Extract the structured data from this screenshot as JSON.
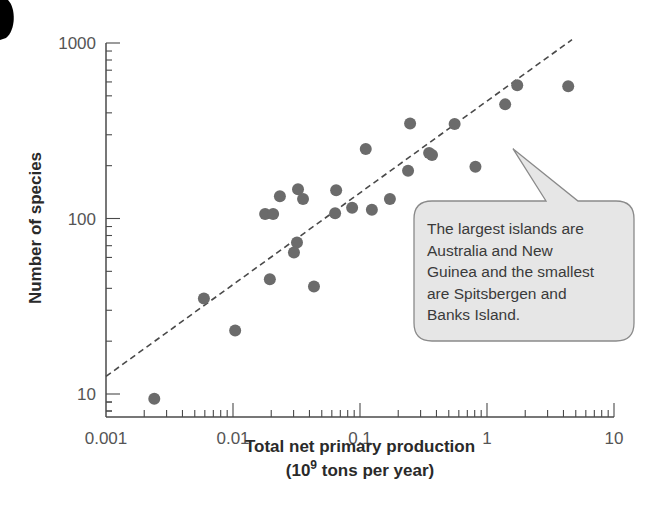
{
  "chart_data": {
    "type": "scatter",
    "title": "",
    "xlabel": "Total net primary production",
    "xlabel_line2_prefix": "(10",
    "xlabel_line2_sup": "9",
    "xlabel_line2_suffix": " tons per year)",
    "ylabel": "Number of species",
    "xscale": "log",
    "yscale": "log",
    "xlim": [
      0.001,
      10
    ],
    "ylim": [
      8,
      1000
    ],
    "x_ticks": [
      0.001,
      0.01,
      0.1,
      1,
      10
    ],
    "x_tick_labels": [
      "0.001",
      "0.01",
      "0.1",
      "1",
      "10"
    ],
    "y_ticks": [
      10,
      100,
      1000
    ],
    "y_tick_labels": [
      "10",
      "100",
      "1000"
    ],
    "grid": false,
    "legend": null,
    "series": [
      {
        "name": "Islands",
        "points": [
          {
            "x": 0.0024,
            "y": 9.4
          },
          {
            "x": 0.0059,
            "y": 35
          },
          {
            "x": 0.0104,
            "y": 23
          },
          {
            "x": 0.0179,
            "y": 106
          },
          {
            "x": 0.0207,
            "y": 106
          },
          {
            "x": 0.0195,
            "y": 45
          },
          {
            "x": 0.0234,
            "y": 134
          },
          {
            "x": 0.0325,
            "y": 147
          },
          {
            "x": 0.0356,
            "y": 129
          },
          {
            "x": 0.0319,
            "y": 73
          },
          {
            "x": 0.0302,
            "y": 64
          },
          {
            "x": 0.0434,
            "y": 41
          },
          {
            "x": 0.0649,
            "y": 145
          },
          {
            "x": 0.0637,
            "y": 107
          },
          {
            "x": 0.0867,
            "y": 115
          },
          {
            "x": 0.124,
            "y": 112
          },
          {
            "x": 0.111,
            "y": 249
          },
          {
            "x": 0.172,
            "y": 129
          },
          {
            "x": 0.239,
            "y": 187
          },
          {
            "x": 0.248,
            "y": 348
          },
          {
            "x": 0.35,
            "y": 236
          },
          {
            "x": 0.369,
            "y": 230
          },
          {
            "x": 0.556,
            "y": 345
          },
          {
            "x": 0.811,
            "y": 197
          },
          {
            "x": 1.39,
            "y": 447
          },
          {
            "x": 1.73,
            "y": 575
          },
          {
            "x": 4.36,
            "y": 567
          }
        ]
      }
    ],
    "regression_line": {
      "style": "dashed",
      "start": {
        "x": 0.001,
        "y": 12.6
      },
      "end": {
        "x": 4.67,
        "y": 1045
      }
    },
    "annotations": [
      {
        "type": "callout",
        "lines": [
          "The largest islands are",
          "Australia and New",
          "Guinea and the smallest",
          "are Spitsbergen and",
          "Banks Island."
        ],
        "points_to": {
          "x": 1.6,
          "y": 250
        }
      }
    ],
    "colors": {
      "points": "#6b6b6b",
      "axis": "#4a4a4a",
      "line": "#4a4a4a",
      "callout_fill": "#e6e6e6",
      "callout_border": "#8a8a8a"
    }
  }
}
